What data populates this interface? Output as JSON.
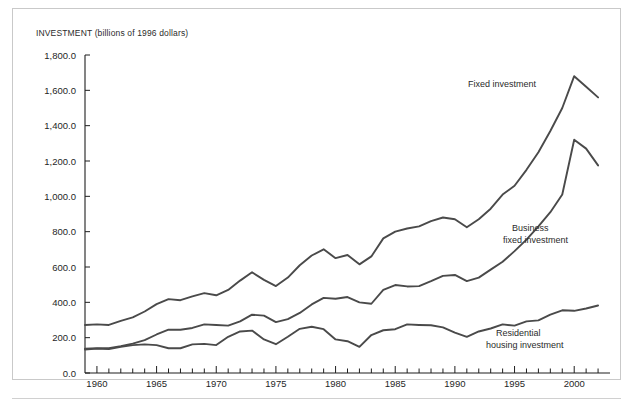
{
  "figure": {
    "title": "INVESTMENT (billions of 1996 dollars)",
    "border_color": "#c9c9c9",
    "line_color": "#4a4a4a",
    "background": "#ffffff"
  },
  "chart_data": {
    "type": "line",
    "title": "INVESTMENT (billions of 1996 dollars)",
    "xlabel": "",
    "ylabel": "INVESTMENT (billions of 1996 dollars)",
    "xlim": [
      1959,
      2003
    ],
    "ylim": [
      0,
      1800
    ],
    "grid": false,
    "legend_position": "inline-annotations",
    "y_ticks": [
      0,
      200,
      400,
      600,
      800,
      1000,
      1200,
      1400,
      1600,
      1800
    ],
    "y_tick_labels": [
      "0.0",
      "200.0",
      "400.0",
      "600.0",
      "800.0",
      "1,000.0",
      "1,200.0",
      "1,400.0",
      "1,600.0",
      "1,800.0"
    ],
    "x_ticks": [
      1960,
      1965,
      1970,
      1975,
      1980,
      1985,
      1990,
      1995,
      2000
    ],
    "x_tick_labels": [
      "1960",
      "1965",
      "1970",
      "1975",
      "1980",
      "1985",
      "1990",
      "1995",
      "2000"
    ],
    "x_minor_tick_interval": 1,
    "x": [
      1959,
      1960,
      1961,
      1962,
      1963,
      1964,
      1965,
      1966,
      1967,
      1968,
      1969,
      1970,
      1971,
      1972,
      1973,
      1974,
      1975,
      1976,
      1977,
      1978,
      1979,
      1980,
      1981,
      1982,
      1983,
      1984,
      1985,
      1986,
      1987,
      1988,
      1989,
      1990,
      1991,
      1992,
      1993,
      1994,
      1995,
      1996,
      1997,
      1998,
      1999,
      2000,
      2001,
      2002
    ],
    "series": [
      {
        "name": "Fixed investment",
        "label_lines": [
          "Fixed investment"
        ],
        "values": [
          272,
          275,
          272,
          295,
          315,
          348,
          390,
          418,
          412,
          434,
          452,
          440,
          470,
          523,
          570,
          527,
          492,
          540,
          610,
          665,
          700,
          650,
          668,
          615,
          660,
          762,
          800,
          818,
          830,
          860,
          880,
          870,
          825,
          870,
          930,
          1010,
          1060,
          1150,
          1250,
          1370,
          1500,
          1680,
          1620,
          1560
        ]
      },
      {
        "name": "Business fixed investment",
        "label_lines": [
          "Business",
          "fixed investment"
        ],
        "values": [
          138,
          140,
          140,
          152,
          166,
          186,
          218,
          245,
          245,
          255,
          275,
          272,
          268,
          292,
          330,
          325,
          288,
          305,
          340,
          388,
          425,
          420,
          430,
          400,
          392,
          470,
          498,
          490,
          492,
          520,
          550,
          555,
          520,
          540,
          585,
          630,
          690,
          755,
          830,
          910,
          1010,
          1320,
          1270,
          1175
        ]
      },
      {
        "name": "Residential housing investment",
        "label_lines": [
          "Residential",
          "housing investment"
        ],
        "values": [
          133,
          138,
          135,
          148,
          158,
          162,
          158,
          140,
          140,
          162,
          165,
          158,
          205,
          235,
          240,
          190,
          163,
          205,
          250,
          262,
          248,
          190,
          180,
          148,
          215,
          242,
          248,
          275,
          272,
          270,
          258,
          228,
          205,
          235,
          252,
          275,
          268,
          292,
          298,
          330,
          355,
          352,
          365,
          382
        ]
      }
    ],
    "annotations": [
      {
        "text": "Fixed investment",
        "series": "Fixed investment",
        "x": 468,
        "y": 87
      },
      {
        "text": "Business",
        "series": "Business fixed investment",
        "x": 512,
        "y": 231
      },
      {
        "text": "fixed investment",
        "series": "Business fixed investment",
        "x": 503,
        "y": 243
      },
      {
        "text": "Residential",
        "series": "Residential housing investment",
        "x": 496,
        "y": 336
      },
      {
        "text": "housing investment",
        "series": "Residential housing investment",
        "x": 486,
        "y": 348
      }
    ]
  }
}
